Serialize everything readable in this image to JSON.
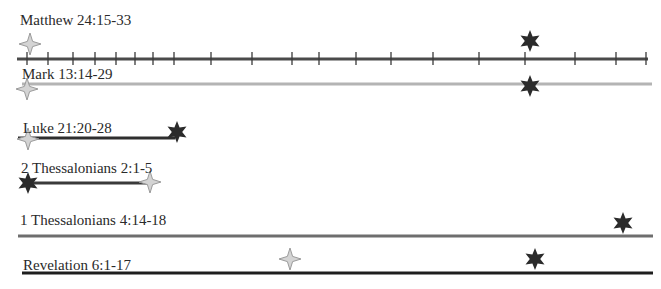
{
  "rows": [
    {
      "id": "matthew",
      "label": "Matthew 24:15-33",
      "label_pos": [
        20,
        12
      ],
      "line": {
        "x1": 17,
        "x2": 648,
        "y": 59,
        "color": "#4a4a4a",
        "width": 3
      },
      "ticks": [
        27,
        48,
        73,
        95,
        116,
        135,
        153,
        174,
        211,
        252,
        292,
        319,
        356,
        391,
        433,
        479,
        525,
        575,
        616,
        646
      ],
      "markers": [
        {
          "type": "four-point-star",
          "x": 30,
          "y": 44
        },
        {
          "type": "six-point-star",
          "x": 530,
          "y": 41
        }
      ]
    },
    {
      "id": "mark",
      "label": "Mark 13:14-29",
      "label_pos": [
        22,
        66
      ],
      "line": {
        "x1": 22,
        "x2": 652,
        "y": 84,
        "color": "#b4b4b4",
        "width": 3
      },
      "ticks": [],
      "markers": [
        {
          "type": "four-point-star",
          "x": 27,
          "y": 89
        },
        {
          "type": "six-point-star",
          "x": 530,
          "y": 86
        }
      ]
    },
    {
      "id": "luke",
      "label": "Luke 21:20-28",
      "label_pos": [
        23,
        120
      ],
      "line": {
        "x1": 18,
        "x2": 175,
        "y": 138,
        "color": "#2e2e2e",
        "width": 3
      },
      "ticks": [],
      "markers": [
        {
          "type": "four-point-star",
          "x": 28,
          "y": 139
        },
        {
          "type": "six-point-star",
          "x": 177,
          "y": 132
        }
      ]
    },
    {
      "id": "2-thessalonians",
      "label": "2 Thessalonians 2:1-5",
      "label_pos": [
        21,
        160
      ],
      "line": {
        "x1": 24,
        "x2": 148,
        "y": 183,
        "color": "#3a3a3a",
        "width": 3
      },
      "ticks": [],
      "markers": [
        {
          "type": "six-point-star",
          "x": 28,
          "y": 183
        },
        {
          "type": "four-point-star",
          "x": 150,
          "y": 182
        }
      ]
    },
    {
      "id": "1-thessalonians",
      "label": "1 Thessalonians 4:14-18",
      "label_pos": [
        20,
        212
      ],
      "line": {
        "x1": 18,
        "x2": 653,
        "y": 236,
        "color": "#6e6e6e",
        "width": 3
      },
      "ticks": [],
      "markers": [
        {
          "type": "six-point-star",
          "x": 623,
          "y": 223
        }
      ]
    },
    {
      "id": "revelation",
      "label": "Revelation 6:1-17",
      "label_pos": [
        23,
        257
      ],
      "line": {
        "x1": 22,
        "x2": 653,
        "y": 273,
        "color": "#1e1e1e",
        "width": 3
      },
      "ticks": [],
      "markers": [
        {
          "type": "four-point-star",
          "x": 290,
          "y": 259
        },
        {
          "type": "six-point-star",
          "x": 535,
          "y": 259
        }
      ]
    }
  ],
  "colors": {
    "four_point_star_fill": "#d4d4d4",
    "four_point_star_stroke": "#9a9a9a",
    "six_point_star_fill": "#2b2b2b"
  }
}
